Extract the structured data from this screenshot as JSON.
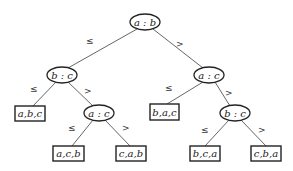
{
  "diagram": {
    "type": "decision-tree",
    "nodes": {
      "root": {
        "label": "a : b"
      },
      "left": {
        "label": "b : c"
      },
      "right": {
        "label": "a : c"
      },
      "left_right": {
        "label": "a : c"
      },
      "right_right": {
        "label": "b : c"
      }
    },
    "leaves": {
      "abc": {
        "label": "a,b,c"
      },
      "acb": {
        "label": "a,c,b"
      },
      "cab": {
        "label": "c,a,b"
      },
      "bac": {
        "label": "b,a,c"
      },
      "bca": {
        "label": "b,c,a"
      },
      "cba": {
        "label": "c,b,a"
      }
    },
    "edge_labels": {
      "le": "≤",
      "gt": ">"
    }
  }
}
